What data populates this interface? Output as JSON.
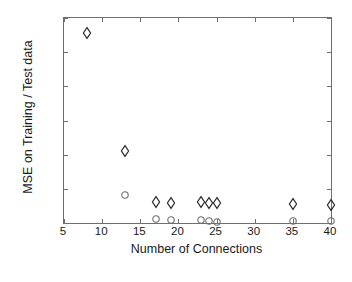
{
  "chart_data": {
    "type": "scatter",
    "title": "",
    "xlabel": "Number of Connections",
    "ylabel": "MSE on Training / Test data",
    "xlim": [
      5,
      40
    ],
    "ylim": [
      0,
      0.12
    ],
    "grid": false,
    "legend": "none",
    "xticks": [
      5,
      10,
      15,
      20,
      25,
      30,
      35,
      40
    ],
    "xtick_labels": [
      "5",
      "10",
      "15",
      "20",
      "25",
      "30",
      "35",
      "40"
    ],
    "yticks": [
      0,
      0.02,
      0.04,
      0.06,
      0.08,
      0.1,
      0.12
    ],
    "ytick_labels": [
      "0",
      "0.02",
      "0.04",
      "0.06",
      "0.08",
      "0.1",
      "0.12"
    ],
    "series": [
      {
        "name": "Training MSE",
        "marker": "diamond",
        "color": "#2b2b2b",
        "points": [
          {
            "x": 8,
            "y": 0.1112
          },
          {
            "x": 13,
            "y": 0.0424
          },
          {
            "x": 17,
            "y": 0.0122
          },
          {
            "x": 19,
            "y": 0.012
          },
          {
            "x": 23,
            "y": 0.0122
          },
          {
            "x": 24,
            "y": 0.012
          },
          {
            "x": 25,
            "y": 0.0115
          },
          {
            "x": 35,
            "y": 0.011
          },
          {
            "x": 40,
            "y": 0.0103
          }
        ]
      },
      {
        "name": "Test MSE",
        "marker": "circle",
        "color": "#6f6f6f",
        "points": [
          {
            "x": 13,
            "y": 0.0165
          },
          {
            "x": 17,
            "y": 0.0025
          },
          {
            "x": 19,
            "y": 0.0015
          },
          {
            "x": 23,
            "y": 0.0016
          },
          {
            "x": 24,
            "y": 0.0012
          },
          {
            "x": 25,
            "y": 0.0008
          },
          {
            "x": 35,
            "y": 0.001
          },
          {
            "x": 40,
            "y": 0.001
          }
        ]
      }
    ]
  },
  "axes": {
    "x_title": "Number of Connections",
    "y_title": "MSE on Training / Test data"
  }
}
